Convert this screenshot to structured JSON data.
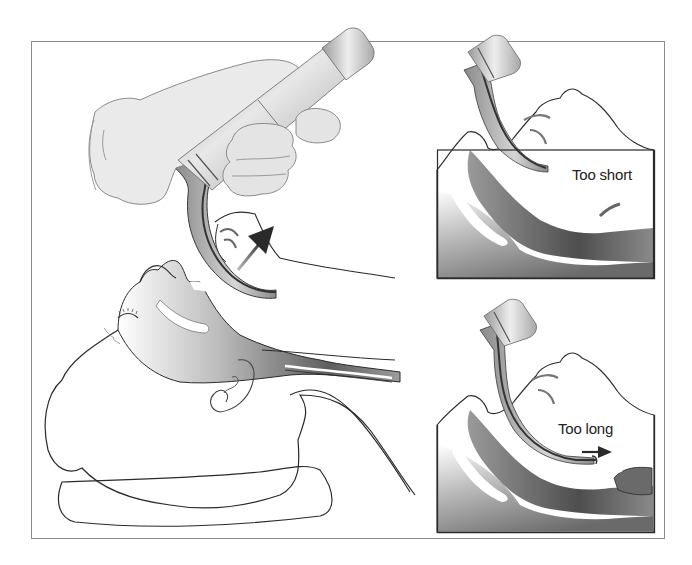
{
  "figure": {
    "main_panel": {
      "description": "Gloved hand holding laryngoscope; blade inserted into infant's mouth with head positioned on a shoulder roll; arrow shows direction of lift",
      "arrow": "lift-direction-arrow"
    },
    "insets": [
      {
        "id": "inset-too-short",
        "label": "Too short"
      },
      {
        "id": "inset-too-long",
        "label": "Too long"
      }
    ]
  },
  "colors": {
    "frame": "#8a8a8a",
    "inset_border": "#333333",
    "outline": "#2a2a2a",
    "tissue_dark": "#555555",
    "tissue_mid": "#9a9a9a",
    "tissue_light": "#f2f2f2",
    "metal_dark": "#7a7a7a",
    "metal_light": "#e6e6e6",
    "glove": "#e9e9e9",
    "text": "#222222"
  }
}
